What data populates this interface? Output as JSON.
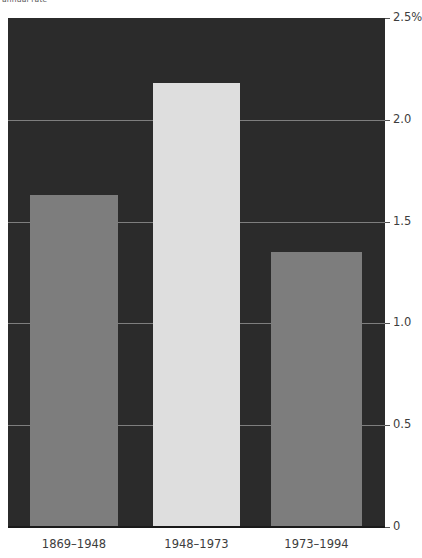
{
  "chart_data": {
    "type": "bar",
    "title": "annual rate",
    "categories": [
      "1869–1948",
      "1948–1973",
      "1973–1994"
    ],
    "values": [
      1.63,
      2.18,
      1.35
    ],
    "series": [
      {
        "name": "growth rate",
        "values": [
          1.63,
          2.18,
          1.35
        ]
      }
    ],
    "xlabel": "",
    "ylabel": "",
    "ylim": [
      0,
      2.5
    ],
    "yticks": [
      0,
      0.5,
      1.0,
      1.5,
      2.0,
      2.5
    ],
    "ytick_labels": [
      "0",
      "0.5",
      "1.0",
      "1.5",
      "2.0",
      "2.5%"
    ],
    "grid": true,
    "grid_axis": "y",
    "legend": false,
    "legend_position": "none",
    "axis_position": "right",
    "bar_colors": [
      "#7d7d7d",
      "#dedede",
      "#7d7d7d"
    ],
    "plot_background": "#2b2b2b",
    "figure_background": "#ffffff",
    "gridline_color": "#8d8d8d",
    "tick_label_color": "#3d3d3d"
  }
}
